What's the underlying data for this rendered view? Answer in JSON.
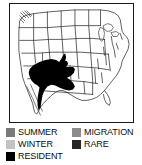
{
  "map": {
    "title": "North America range map",
    "region": "Contiguous United States",
    "frame_color": "#1a1a1a",
    "land_fill": "#ffffff",
    "border_color": "#1a1a1a",
    "range_fill": "#000000",
    "range_category": "RESIDENT",
    "range_description": "Solid black resident range over the southwestern United States (Arizona, New Mexico, western Texas) extending south into northern Mexico"
  },
  "legend": {
    "rows": [
      {
        "left": {
          "label": "SUMMER",
          "color": "#7a7a7a",
          "swatch": "summer-swatch"
        },
        "right": {
          "label": "MIGRATION",
          "color": "#8c8c8c",
          "swatch": "migration-swatch"
        }
      },
      {
        "left": {
          "label": "WINTER",
          "color": "#c2c2c2",
          "swatch": "winter-swatch"
        },
        "right": {
          "label": "RARE",
          "color": "#262626",
          "swatch": "rare-swatch"
        }
      },
      {
        "left": {
          "label": "RESIDENT",
          "color": "#000000",
          "swatch": "resident-swatch"
        },
        "right": null
      }
    ]
  }
}
